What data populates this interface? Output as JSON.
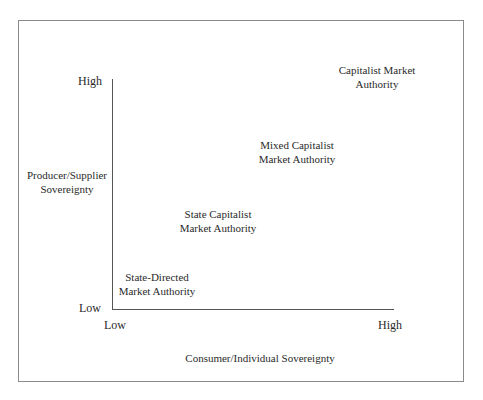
{
  "diagram": {
    "type": "two-axis positioning diagram",
    "y_axis": {
      "label_line1": "Producer/Supplier",
      "label_line2": "Sovereignty",
      "high": "High",
      "low": "Low"
    },
    "x_axis": {
      "label": "Consumer/Individual Sovereignty",
      "low": "Low",
      "high": "High"
    },
    "regions": [
      {
        "line1": "State-Directed",
        "line2": "Market Authority"
      },
      {
        "line1": "State Capitalist",
        "line2": "Market Authority"
      },
      {
        "line1": "Mixed Capitalist",
        "line2": "Market Authority"
      },
      {
        "line1": "Capitalist Market",
        "line2": "Authority"
      }
    ]
  }
}
